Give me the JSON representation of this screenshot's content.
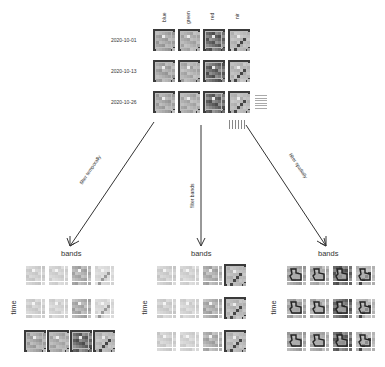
{
  "cube": {
    "band_labels": [
      "blue",
      "green",
      "red",
      "nir"
    ],
    "dates": [
      "2020-10-01",
      "2020-10-13",
      "2020-10-26"
    ]
  },
  "arrows": [
    {
      "label": "filter temporally"
    },
    {
      "label": "filter bands"
    },
    {
      "label": "filter spatially"
    }
  ],
  "panels": [
    {
      "title": "bands",
      "axis": "time",
      "highlight": "last-row"
    },
    {
      "title": "bands",
      "axis": "time",
      "highlight": "last-column"
    },
    {
      "title": "bands",
      "axis": "time",
      "highlight": "spatial-region"
    }
  ],
  "colors": {
    "frame": "#3a3a3a",
    "arrow": "#333333",
    "tile_light": "#c8c8c8",
    "tile_dark": "#555555"
  }
}
